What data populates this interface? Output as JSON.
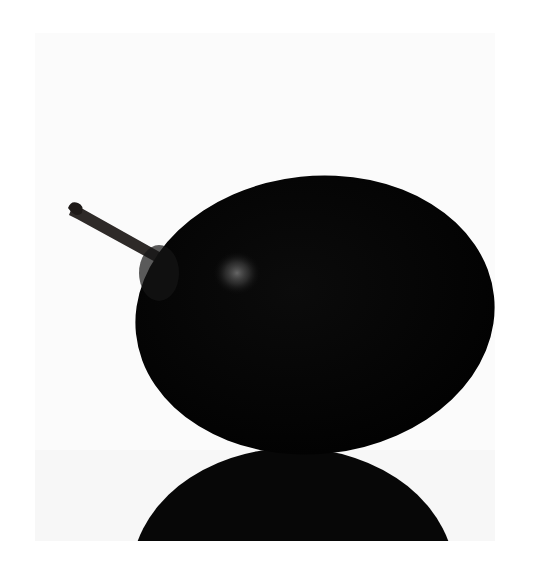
{
  "image": {
    "description": "A dark plum with a short stem on a white background, with its reflection below",
    "subject": "plum",
    "colors": {
      "frame": "#ffffff",
      "background": "#fbfbfb",
      "reflection_surface": "#f7f7f7",
      "fruit": "#050505",
      "highlight": "#6a6a6a",
      "stem": "#2e2a28"
    }
  }
}
